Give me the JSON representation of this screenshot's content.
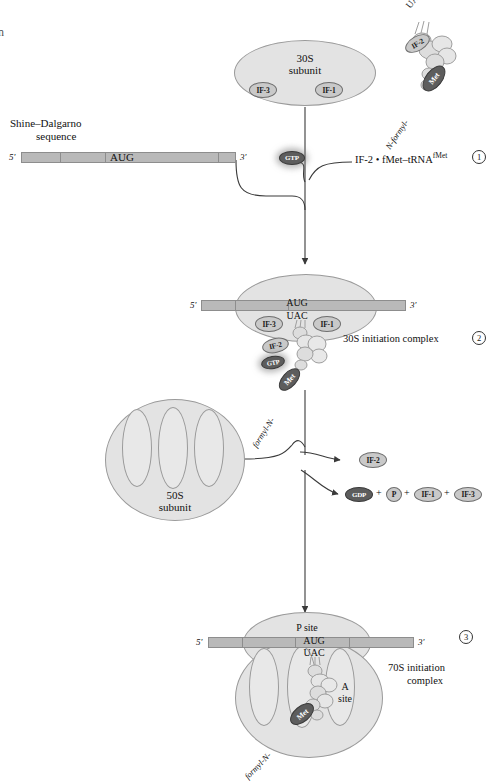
{
  "figure": {
    "edge_artifact": "n"
  },
  "mrna": {
    "five_prime": "5'",
    "three_prime": "3'",
    "shine_dalgarno_line1": "Shine–Dalgarno",
    "shine_dalgarno_line2": "sequence",
    "start_codon": "AUG",
    "anticodon": "UAC"
  },
  "step1": {
    "subunit_line1": "30S",
    "subunit_line2": "subunit",
    "if3": "IF-3",
    "if1": "IF-1",
    "gtp": "GTP",
    "trna_anticodon": "UAC",
    "trna_if2": "IF-2",
    "trna_met": "Met",
    "trna_formyl": "N-formyl-",
    "reactant_label": "IF-2 • fMet–tRNA",
    "reactant_superscript": "fMet",
    "number": "1"
  },
  "step2": {
    "five_prime": "5'",
    "three_prime": "3'",
    "codon": "AUG",
    "anticodon": "UAC",
    "if3": "IF-3",
    "if1": "IF-1",
    "if2": "IF-2",
    "gtp": "GTP",
    "met": "Met",
    "formyl": "formyl-N-",
    "label": "30S initiation complex",
    "number": "2"
  },
  "step3": {
    "subunit_line1": "50S",
    "subunit_line2": "subunit",
    "released_if2": "IF-2",
    "released_gdp": "GDP",
    "released_pi": "P",
    "released_if1": "IF-1",
    "released_if3": "IF-3",
    "plus": "+"
  },
  "step4": {
    "five_prime": "5'",
    "three_prime": "3'",
    "codon": "AUG",
    "anticodon": "UAC",
    "p_site": "P site",
    "a_site_line1": "A",
    "a_site_line2": "site",
    "met": "Met",
    "formyl": "formyl-N-",
    "label_line1": "70S initiation",
    "label_line2": "complex",
    "number": "3"
  },
  "colors": {
    "subunit_fill": "#e3e3e3",
    "subunit_stroke": "#9a9a9a",
    "mrna_fill": "#b9b9b9",
    "badge_light": "#c9c9c9",
    "badge_dark": "#5d5d5d",
    "line": "#3a3a3a"
  }
}
